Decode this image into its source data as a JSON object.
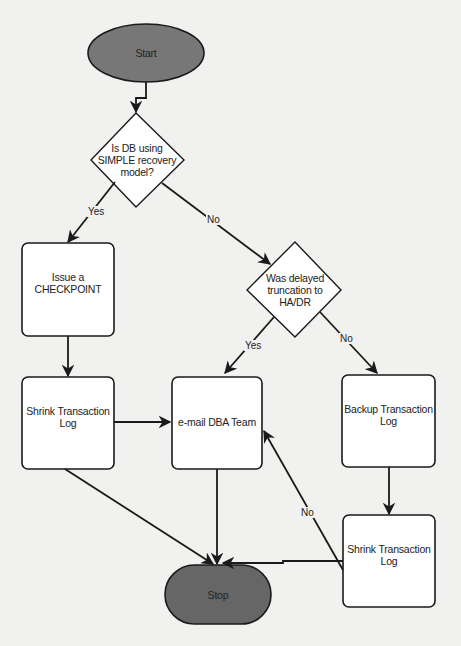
{
  "diagram": {
    "type": "flowchart",
    "colors": {
      "background": "#f1f1ef",
      "terminal_fill": "#777777",
      "box_fill": "#ffffff",
      "stroke": "#1a1a1a"
    },
    "nodes": {
      "start": {
        "label": "Start",
        "shape": "ellipse"
      },
      "decision_simple": {
        "label": "Is DB using SIMPLE recovery model?",
        "line1": "Is DB using",
        "line2": "SIMPLE recovery",
        "line3": "model?",
        "shape": "diamond"
      },
      "checkpoint": {
        "label": "Issue a CHECKPOINT",
        "line1": "Issue a",
        "line2": "CHECKPOINT",
        "shape": "rounded-rect"
      },
      "decision_hadr": {
        "label": "Was delayed truncation to HA/DR",
        "line1": "Was delayed",
        "line2": "truncation to",
        "line3": "HA/DR",
        "shape": "diamond"
      },
      "shrink_left": {
        "label": "Shrink Transaction Log",
        "line1": "Shrink Transaction",
        "line2": "Log",
        "shape": "rounded-rect"
      },
      "email_dba": {
        "label": "e-mail DBA Team",
        "shape": "rounded-rect"
      },
      "backup_log": {
        "label": "Backup Transaction Log",
        "line1": "Backup Transaction",
        "line2": "Log",
        "shape": "rounded-rect"
      },
      "shrink_right": {
        "label": "Shrink Transaction Log",
        "line1": "Shrink Transaction",
        "line2": "Log",
        "shape": "rounded-rect"
      },
      "stop": {
        "label": "Stop",
        "shape": "ellipse"
      }
    },
    "edges": [
      {
        "from": "start",
        "to": "decision_simple",
        "label": ""
      },
      {
        "from": "decision_simple",
        "to": "checkpoint",
        "label": "Yes"
      },
      {
        "from": "decision_simple",
        "to": "decision_hadr",
        "label": "No"
      },
      {
        "from": "checkpoint",
        "to": "shrink_left",
        "label": ""
      },
      {
        "from": "decision_hadr",
        "to": "email_dba",
        "label": "Yes"
      },
      {
        "from": "decision_hadr",
        "to": "backup_log",
        "label": "No"
      },
      {
        "from": "shrink_left",
        "to": "email_dba",
        "label": ""
      },
      {
        "from": "shrink_left",
        "to": "stop",
        "label": ""
      },
      {
        "from": "email_dba",
        "to": "stop",
        "label": ""
      },
      {
        "from": "backup_log",
        "to": "shrink_right",
        "label": ""
      },
      {
        "from": "shrink_right",
        "to": "stop",
        "label": ""
      },
      {
        "from": "shrink_right",
        "to": "email_dba",
        "label": "No"
      }
    ],
    "edge_labels": {
      "simple_yes": "Yes",
      "simple_no": "No",
      "hadr_yes": "Yes",
      "hadr_no": "No",
      "shrink_right_no": "No"
    }
  }
}
